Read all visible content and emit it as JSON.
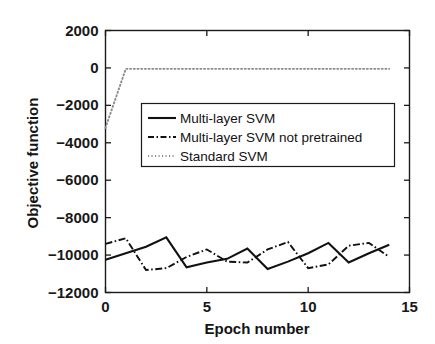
{
  "chart_data": {
    "type": "line",
    "title": "",
    "xlabel": "Epoch number",
    "ylabel": "Objective function",
    "xlim": [
      0,
      15
    ],
    "ylim": [
      -12000,
      2000
    ],
    "xticks": [
      0,
      5,
      10,
      15
    ],
    "xtick_labels": [
      "0",
      "5",
      "10",
      "15"
    ],
    "yticks": [
      2000,
      0,
      -2000,
      -4000,
      -6000,
      -8000,
      -10000,
      -12000
    ],
    "ytick_labels": [
      "2000",
      "0",
      "-2000",
      "-4000",
      "-6000",
      "-8000",
      "-10000",
      "-12000"
    ],
    "grid": false,
    "legend_position": "upper center",
    "x": [
      0,
      1,
      2,
      3,
      4,
      5,
      6,
      7,
      8,
      9,
      10,
      11,
      12,
      13,
      14
    ],
    "series": [
      {
        "name": "Multi-layer SVM",
        "style": "solid",
        "color": "#111111",
        "values": [
          -10250,
          -9900,
          -9550,
          -9050,
          -10650,
          -10400,
          -10200,
          -9650,
          -10750,
          -10350,
          -9900,
          -9350,
          -10400,
          -9900,
          -9450
        ]
      },
      {
        "name": "Multi-layer SVM not pretrained",
        "style": "dashdot",
        "color": "#111111",
        "values": [
          -9400,
          -9100,
          -10800,
          -10700,
          -10100,
          -9700,
          -10350,
          -10400,
          -9700,
          -9300,
          -10700,
          -10500,
          -9500,
          -9350,
          -10100
        ]
      },
      {
        "name": "Standard SVM",
        "style": "dotted",
        "color": "#8a8a8a",
        "values": [
          -3200,
          -50,
          -50,
          -50,
          -50,
          -50,
          -50,
          -50,
          -50,
          -50,
          -50,
          -50,
          -50,
          -50,
          -50
        ]
      }
    ]
  },
  "legend": {
    "entries": [
      {
        "label": "Multi-layer SVM"
      },
      {
        "label": "Multi-layer SVM not pretrained"
      },
      {
        "label": "Standard SVM"
      }
    ]
  },
  "axes": {
    "x_title": "Epoch number",
    "y_title": "Objective function"
  },
  "colors": {
    "frame": "#1a1a1a",
    "series_primary": "#111111",
    "series_secondary": "#111111",
    "series_tertiary": "#8a8a8a",
    "text": "#141414",
    "background": "#ffffff"
  }
}
